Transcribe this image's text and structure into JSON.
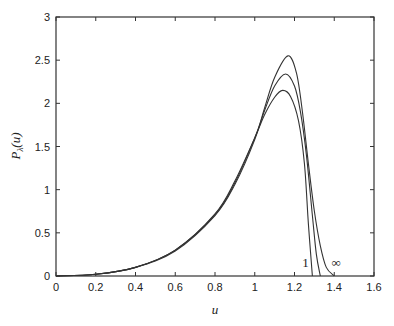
{
  "chart_data": {
    "type": "line",
    "title": "",
    "xlabel": "u",
    "ylabel": "P_λ(u)",
    "xlim": [
      0,
      1.6
    ],
    "ylim": [
      0,
      3
    ],
    "xticks": [
      "0",
      "0.2",
      "0.4",
      "0.6",
      "0.8",
      "1",
      "1.2",
      "1.4",
      "1.6"
    ],
    "yticks": [
      "0",
      "0.5",
      "1",
      "1.5",
      "2",
      "2.5",
      "3"
    ],
    "grid": false,
    "legend": "none",
    "annotations": [
      {
        "text": "1",
        "x": 1.255,
        "y": 0.1
      },
      {
        "text": "∞",
        "x": 1.41,
        "y": 0.1
      }
    ],
    "series": [
      {
        "name": "λ = 1",
        "x": [
          0,
          0.2,
          0.4,
          0.6,
          0.8,
          0.9,
          1.0,
          1.05,
          1.1,
          1.14,
          1.18,
          1.22,
          1.25,
          1.27,
          1.29
        ],
        "y": [
          0,
          0.02,
          0.1,
          0.3,
          0.72,
          1.1,
          1.6,
          1.87,
          2.07,
          2.15,
          2.08,
          1.8,
          1.3,
          0.6,
          0
        ]
      },
      {
        "name": "λ intermediate",
        "x": [
          0,
          0.2,
          0.4,
          0.6,
          0.8,
          0.9,
          1.0,
          1.05,
          1.1,
          1.155,
          1.2,
          1.23,
          1.26,
          1.29,
          1.31,
          1.33
        ],
        "y": [
          0,
          0.02,
          0.1,
          0.3,
          0.71,
          1.08,
          1.6,
          1.92,
          2.2,
          2.34,
          2.2,
          1.9,
          1.4,
          0.7,
          0.25,
          0
        ]
      },
      {
        "name": "λ = ∞",
        "x": [
          0,
          0.2,
          0.4,
          0.6,
          0.8,
          0.9,
          1.0,
          1.05,
          1.1,
          1.167,
          1.21,
          1.24,
          1.27,
          1.3,
          1.33,
          1.36,
          1.4
        ],
        "y": [
          0,
          0.02,
          0.1,
          0.29,
          0.7,
          1.06,
          1.58,
          1.95,
          2.3,
          2.55,
          2.35,
          1.9,
          1.3,
          0.75,
          0.35,
          0.1,
          0
        ]
      }
    ]
  }
}
